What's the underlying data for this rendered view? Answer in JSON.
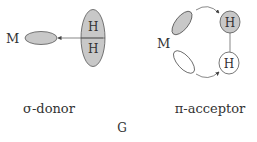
{
  "diagram": {
    "left_panel": {
      "metal_label": "M",
      "h_top_label": "H",
      "h_bottom_label": "H",
      "caption": "σ-donor"
    },
    "right_panel": {
      "metal_label": "M",
      "h_top_label": "H",
      "h_bottom_label": "H",
      "caption": "π-acceptor"
    },
    "figure_label": "G",
    "colors": {
      "filled": "#c8c8c8",
      "stroke": "#555555",
      "text": "#333333",
      "empty": "#ffffff"
    }
  }
}
